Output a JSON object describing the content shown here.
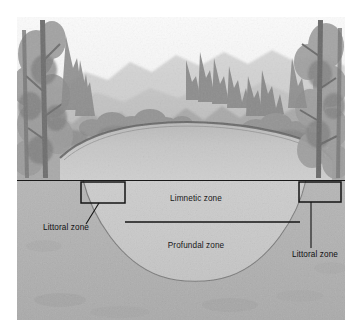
{
  "figure": {
    "name": "lake-zonation-cross-section",
    "caption_present": false,
    "canvas": {
      "width": 362,
      "height": 335,
      "background": "#ffffff"
    },
    "artwork_bounds": {
      "x": 17,
      "y": 17,
      "width": 328,
      "height": 303
    },
    "style": "grayscale halftone illustration",
    "waterline_y": 180
  },
  "colors": {
    "page_background": "#ffffff",
    "sky": "#f2f2f2",
    "mountain_far": "#cfcfcf",
    "mountain_near": "#bcbcbc",
    "forest_mid": "#a8a8a8",
    "forest_dark": "#7d7d7d",
    "tree_trunk": "#6b6b6b",
    "lake_surface": "#c4c4c4",
    "shoreline_dark": "#5d5d5d",
    "ground_fill": "#b2b2b2",
    "ground_texture": "#a9a9a9",
    "water_body": "#cacaca",
    "water_body_light": "#d2d2d2",
    "outline": "#1a1a1a",
    "label_text": "#151515"
  },
  "scene": {
    "sky_label": "sky",
    "mountains_label": "background-mountains",
    "forest_label": "shoreline-forest",
    "left_trees_label": "left-foreground-trees",
    "right_trees_label": "right-foreground-trees",
    "lake_surface_label": "lake-surface"
  },
  "cross_section": {
    "ground_label": "ground-substrate",
    "basin_label": "lake-basin-water",
    "basin": {
      "left_rim_x": 83,
      "right_rim_x": 306,
      "rim_y": 180,
      "deepest_y": 280,
      "center_x": 194
    },
    "depth_divider": {
      "name": "limnetic-profundal-divider",
      "y": 222,
      "x_start": 125,
      "x_end": 300
    }
  },
  "zones": [
    {
      "id": "limnetic",
      "label": "Limnetic zone",
      "text_x": 196,
      "text_y": 201
    },
    {
      "id": "profundal",
      "label": "Profundal zone",
      "text_x": 196,
      "text_y": 248
    },
    {
      "id": "littoral-left",
      "label": "Littoral zone",
      "text_x": 66,
      "text_y": 230,
      "box": {
        "x": 81,
        "y": 182,
        "width": 44,
        "height": 21
      },
      "leader": {
        "x1": 99,
        "y1": 203,
        "x2": 86,
        "y2": 224
      }
    },
    {
      "id": "littoral-right",
      "label": "Littoral zone",
      "text_x": 315,
      "text_y": 257,
      "box": {
        "x": 299,
        "y": 182,
        "width": 42,
        "height": 20
      },
      "leader": {
        "x1": 311,
        "y1": 202,
        "x2": 311,
        "y2": 248
      }
    }
  ]
}
